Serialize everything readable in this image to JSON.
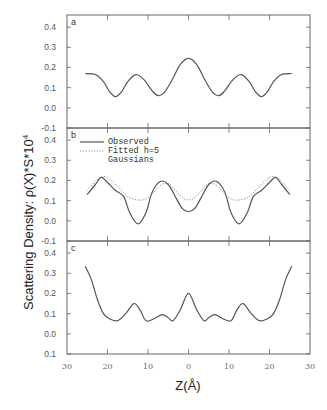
{
  "chart_data": [
    {
      "panel": "a",
      "type": "line",
      "title": "",
      "xlabel": "Z(Å)",
      "ylabel": "Scattering Density:  ρ(X)*S*10⁴",
      "xlim": [
        -30,
        30
      ],
      "ylim": [
        -0.1,
        0.46
      ],
      "yticks": [
        "0.4",
        "0.3",
        "0.2",
        "0.1",
        "0.0",
        "-0.1"
      ],
      "grid": false,
      "series": [
        {
          "name": "Observed",
          "style": "solid",
          "x": [
            -25.5,
            -23,
            -21,
            -19.5,
            -18,
            -16.5,
            -15,
            -13,
            -11,
            -9,
            -7.5,
            -6,
            -4,
            -2,
            0,
            2,
            4,
            6,
            7.5,
            9,
            11,
            13,
            15,
            16.5,
            18,
            19.5,
            21,
            23,
            25.5
          ],
          "y": [
            0.17,
            0.165,
            0.13,
            0.08,
            0.055,
            0.08,
            0.13,
            0.165,
            0.14,
            0.085,
            0.06,
            0.075,
            0.14,
            0.215,
            0.245,
            0.215,
            0.14,
            0.075,
            0.06,
            0.085,
            0.14,
            0.165,
            0.13,
            0.08,
            0.055,
            0.08,
            0.13,
            0.165,
            0.17
          ]
        }
      ]
    },
    {
      "panel": "b",
      "type": "line",
      "xlim": [
        -30,
        30
      ],
      "ylim": [
        -0.1,
        0.46
      ],
      "yticks": [
        "0.4",
        "0.3",
        "0.2",
        "0.1",
        "0.0",
        "-0.1"
      ],
      "legend": [
        "Observed",
        "Fitted h=5",
        "Gaussians"
      ],
      "legend_position": "upper left",
      "series": [
        {
          "name": "Observed",
          "style": "solid",
          "x": [
            -25,
            -23,
            -21.5,
            -20,
            -18,
            -16,
            -14.5,
            -12.5,
            -10.5,
            -9,
            -7,
            -5,
            -3,
            -1.5,
            0,
            1.5,
            3,
            5,
            7,
            9,
            10.5,
            12.5,
            14.5,
            16,
            18,
            20,
            21.5,
            23,
            25
          ],
          "y": [
            0.13,
            0.18,
            0.215,
            0.19,
            0.15,
            0.12,
            0.04,
            -0.015,
            0.04,
            0.14,
            0.195,
            0.18,
            0.11,
            0.06,
            0.045,
            0.06,
            0.11,
            0.18,
            0.195,
            0.14,
            0.04,
            -0.015,
            0.04,
            0.12,
            0.15,
            0.19,
            0.215,
            0.18,
            0.13
          ]
        },
        {
          "name": "Fitted h=5 Gaussians",
          "style": "dotted",
          "x": [
            -25,
            -23,
            -21,
            -19,
            -17,
            -15,
            -13,
            -11,
            -9,
            -7,
            -5,
            -3,
            -1,
            0,
            1,
            3,
            5,
            7,
            9,
            11,
            13,
            15,
            17,
            19,
            21,
            23,
            25
          ],
          "y": [
            0.15,
            0.195,
            0.22,
            0.2,
            0.16,
            0.12,
            0.105,
            0.105,
            0.13,
            0.175,
            0.185,
            0.145,
            0.108,
            0.105,
            0.108,
            0.145,
            0.185,
            0.175,
            0.13,
            0.105,
            0.105,
            0.12,
            0.16,
            0.2,
            0.22,
            0.195,
            0.15
          ]
        }
      ]
    },
    {
      "panel": "c",
      "type": "line",
      "xlim": [
        -30,
        30
      ],
      "ylim": [
        -0.1,
        0.46
      ],
      "yticks": [
        "0.4",
        "0.3",
        "0.2",
        "0.1",
        "0.0",
        "0.1"
      ],
      "xticks": [
        "30",
        "20",
        "10",
        "0",
        "10",
        "20",
        "30"
      ],
      "series": [
        {
          "name": "Observed",
          "style": "solid",
          "x": [
            -25.5,
            -24,
            -22.5,
            -21,
            -19.5,
            -17.5,
            -15.5,
            -13.5,
            -12,
            -10.5,
            -8.5,
            -6.5,
            -5,
            -3.8,
            -2,
            0,
            2,
            3.8,
            5,
            6.5,
            8.5,
            10.5,
            12,
            13.5,
            15.5,
            17.5,
            19.5,
            21,
            22.5,
            24,
            25.5
          ],
          "y": [
            0.335,
            0.27,
            0.17,
            0.1,
            0.075,
            0.065,
            0.1,
            0.15,
            0.12,
            0.065,
            0.075,
            0.095,
            0.08,
            0.065,
            0.12,
            0.2,
            0.12,
            0.065,
            0.08,
            0.095,
            0.075,
            0.065,
            0.12,
            0.15,
            0.1,
            0.065,
            0.075,
            0.1,
            0.17,
            0.27,
            0.335
          ]
        }
      ]
    }
  ],
  "labels": {
    "panel_a": "a",
    "panel_b": "b",
    "panel_c": "c",
    "legend_observed": "Observed",
    "legend_fitted": "Fitted h=5",
    "legend_gaussians": "Gaussians",
    "ylabel": "Scattering Density:  ρ(X)*S*10",
    "ylabel_sup": "4",
    "xlabel": "Z(Å)"
  }
}
